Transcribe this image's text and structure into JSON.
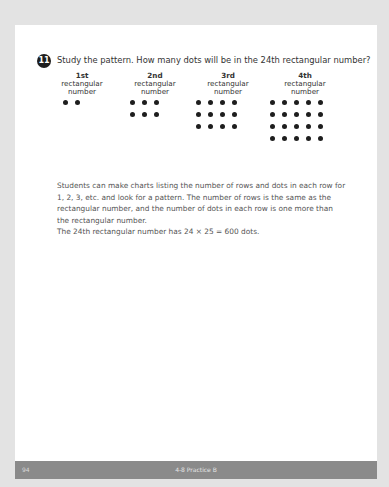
{
  "question": {
    "number": "11",
    "text": "Study the pattern. How many dots will be in the 24th rectangular number?"
  },
  "figures": [
    {
      "ordinal": "1st",
      "line2": "rectangular",
      "line3": "number",
      "rows": 1,
      "cols": 2
    },
    {
      "ordinal": "2nd",
      "line2": "rectangular",
      "line3": "number",
      "rows": 2,
      "cols": 3
    },
    {
      "ordinal": "3rd",
      "line2": "rectangular",
      "line3": "number",
      "rows": 3,
      "cols": 4
    },
    {
      "ordinal": "4th",
      "line2": "rectangular",
      "line3": "number",
      "rows": 4,
      "cols": 5
    }
  ],
  "answer": {
    "paragraph": "Students can make charts listing the number of rows and dots in each row for 1, 2, 3, etc. and look for a pattern. The number of rows is the same as the rectangular number, and the number of dots in each row is one more than the rectangular number.",
    "result": "The 24th rectangular number has 24 × 25 = 600 dots."
  },
  "footer": {
    "page_number": "94",
    "lesson": "4-8 Practice B"
  }
}
